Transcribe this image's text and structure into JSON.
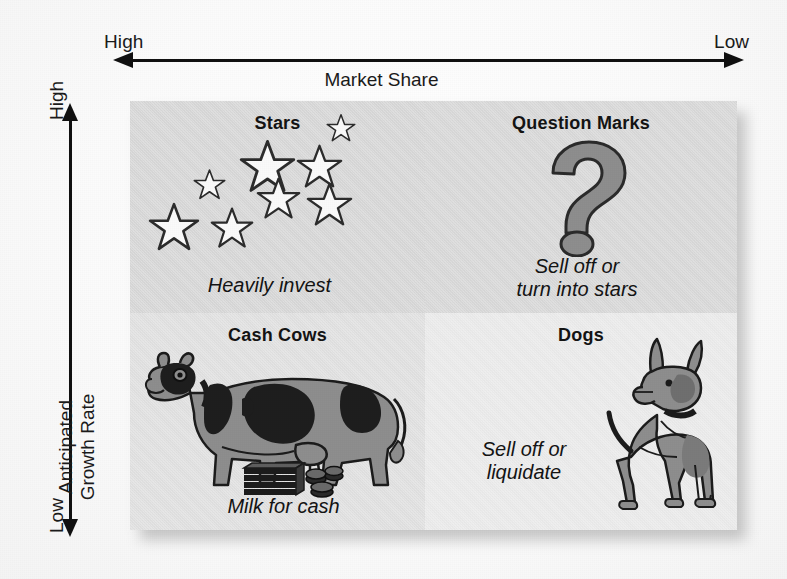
{
  "diagram": {
    "type": "bcg-growth-share-matrix",
    "x_axis": {
      "label": "Market Share",
      "left_cap": "High",
      "right_cap": "Low",
      "direction": "bidirectional"
    },
    "y_axis": {
      "label": "Anticipated\nGrowth Rate",
      "top_cap": "High",
      "bottom_cap": "Low",
      "direction": "bidirectional"
    },
    "quadrants": [
      {
        "id": "stars",
        "title": "Stars",
        "caption": "Heavily invest",
        "position": "top-left",
        "market_share": "High",
        "growth_rate": "High",
        "icon": "stars-icon",
        "background": "#d9d9d9"
      },
      {
        "id": "question-marks",
        "title": "Question Marks",
        "caption": "Sell off or\nturn into stars",
        "position": "top-right",
        "market_share": "Low",
        "growth_rate": "High",
        "icon": "question-mark-icon",
        "background": "#dadada"
      },
      {
        "id": "cash-cows",
        "title": "Cash Cows",
        "caption": "Milk for cash",
        "position": "bottom-left",
        "market_share": "High",
        "growth_rate": "Low",
        "icon": "cow-icon",
        "background": "#e2e2e2"
      },
      {
        "id": "dogs",
        "title": "Dogs",
        "caption": "Sell off or\nliquidate",
        "position": "bottom-right",
        "market_share": "Low",
        "growth_rate": "Low",
        "icon": "dog-icon",
        "background": "#ececec"
      }
    ],
    "colors": {
      "ink": "#141414",
      "figure_gray": "#8c8c8c",
      "figure_dark": "#1e1e1e",
      "star_fill": "#fafafa",
      "page": "#fdfdfd"
    },
    "star_count": 8
  }
}
